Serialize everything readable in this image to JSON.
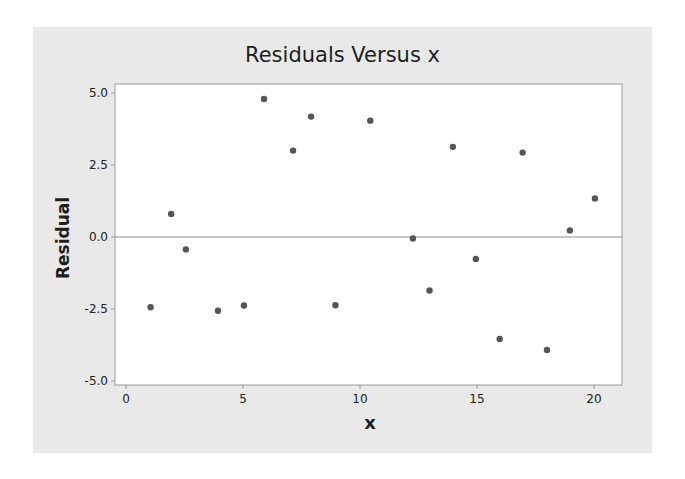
{
  "chart_data": {
    "type": "scatter",
    "title": "Residuals Versus x",
    "xlabel": "x",
    "ylabel": "Residual",
    "xlim": [
      -0.45,
      21.2
    ],
    "ylim": [
      -5.3,
      5.3
    ],
    "x_ticks": [
      0,
      5,
      10,
      15,
      20
    ],
    "x_tick_labels": [
      "0",
      "5",
      "10",
      "15",
      "20"
    ],
    "y_ticks": [
      5.0,
      2.5,
      0.0,
      -2.5,
      -5.0
    ],
    "y_tick_labels": [
      "5.0",
      "2.5",
      "0.0",
      "-2.5",
      "-5.0"
    ],
    "grid": false,
    "reference_line": {
      "y": 0.0,
      "color": "#8c8c8c"
    },
    "marker_color": "#555555",
    "series": [
      {
        "name": "Residual",
        "points": [
          {
            "x": 1.05,
            "y": -2.44
          },
          {
            "x": 1.93,
            "y": 0.8
          },
          {
            "x": 2.56,
            "y": -0.43
          },
          {
            "x": 3.93,
            "y": -2.56
          },
          {
            "x": 5.04,
            "y": -2.38
          },
          {
            "x": 5.9,
            "y": 4.79
          },
          {
            "x": 7.14,
            "y": 3.0
          },
          {
            "x": 7.91,
            "y": 4.18
          },
          {
            "x": 8.95,
            "y": -2.37
          },
          {
            "x": 10.44,
            "y": 4.04
          },
          {
            "x": 12.26,
            "y": -0.05
          },
          {
            "x": 12.97,
            "y": -1.86
          },
          {
            "x": 13.97,
            "y": 3.13
          },
          {
            "x": 14.95,
            "y": -0.76
          },
          {
            "x": 15.97,
            "y": -3.54
          },
          {
            "x": 16.95,
            "y": 2.93
          },
          {
            "x": 17.99,
            "y": -3.92
          },
          {
            "x": 18.97,
            "y": 0.23
          },
          {
            "x": 20.04,
            "y": 1.34
          }
        ]
      }
    ]
  },
  "colors": {
    "panel_bg": "#e9e9e9",
    "plot_bg": "#ffffff",
    "axis": "#9a9a9a",
    "marker": "#555555",
    "text": "#1e1e1e"
  }
}
